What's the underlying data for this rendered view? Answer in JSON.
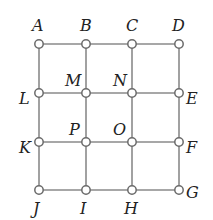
{
  "diagram": {
    "type": "grid-graph",
    "nodes": [
      {
        "id": "A",
        "label": "A",
        "x": 39,
        "y": 44,
        "lx": 32,
        "ly": 31
      },
      {
        "id": "B",
        "label": "B",
        "x": 86,
        "y": 44,
        "lx": 80,
        "ly": 31
      },
      {
        "id": "C",
        "label": "C",
        "x": 132,
        "y": 44,
        "lx": 126,
        "ly": 31
      },
      {
        "id": "D",
        "label": "D",
        "x": 179,
        "y": 44,
        "lx": 172,
        "ly": 31
      },
      {
        "id": "L",
        "label": "L",
        "x": 39,
        "y": 93,
        "lx": 19,
        "ly": 104
      },
      {
        "id": "M",
        "label": "M",
        "x": 86,
        "y": 93,
        "lx": 65,
        "ly": 86
      },
      {
        "id": "N",
        "label": "N",
        "x": 132,
        "y": 93,
        "lx": 113,
        "ly": 86
      },
      {
        "id": "E",
        "label": "E",
        "x": 179,
        "y": 93,
        "lx": 186,
        "ly": 104
      },
      {
        "id": "K",
        "label": "K",
        "x": 39,
        "y": 142,
        "lx": 19,
        "ly": 153
      },
      {
        "id": "P",
        "label": "P",
        "x": 86,
        "y": 142,
        "lx": 69,
        "ly": 135
      },
      {
        "id": "O",
        "label": "O",
        "x": 132,
        "y": 142,
        "lx": 113,
        "ly": 135
      },
      {
        "id": "F",
        "label": "F",
        "x": 179,
        "y": 142,
        "lx": 186,
        "ly": 153
      },
      {
        "id": "J",
        "label": "J",
        "x": 39,
        "y": 190,
        "lx": 33,
        "ly": 214
      },
      {
        "id": "I",
        "label": "I",
        "x": 86,
        "y": 190,
        "lx": 80,
        "ly": 214
      },
      {
        "id": "H",
        "label": "H",
        "x": 132,
        "y": 190,
        "lx": 124,
        "ly": 214
      },
      {
        "id": "G",
        "label": "G",
        "x": 179,
        "y": 190,
        "lx": 186,
        "ly": 198
      }
    ],
    "edges": [
      [
        "A",
        "B"
      ],
      [
        "B",
        "C"
      ],
      [
        "C",
        "D"
      ],
      [
        "L",
        "M"
      ],
      [
        "M",
        "N"
      ],
      [
        "N",
        "E"
      ],
      [
        "K",
        "P"
      ],
      [
        "P",
        "O"
      ],
      [
        "O",
        "F"
      ],
      [
        "J",
        "I"
      ],
      [
        "I",
        "H"
      ],
      [
        "H",
        "G"
      ],
      [
        "A",
        "L"
      ],
      [
        "L",
        "K"
      ],
      [
        "K",
        "J"
      ],
      [
        "B",
        "M"
      ],
      [
        "M",
        "P"
      ],
      [
        "P",
        "I"
      ],
      [
        "C",
        "N"
      ],
      [
        "N",
        "O"
      ],
      [
        "O",
        "H"
      ],
      [
        "D",
        "E"
      ],
      [
        "E",
        "F"
      ],
      [
        "F",
        "G"
      ]
    ],
    "colors": {
      "edge": "#8a8a8a",
      "node_fill": "#ffffff",
      "node_stroke": "#6a6a6a",
      "label": "#222222"
    }
  }
}
